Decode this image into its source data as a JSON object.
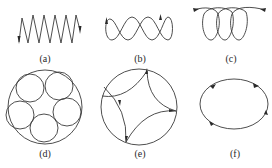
{
  "figure": {
    "panels": [
      {
        "id": "a",
        "label": "(a)",
        "shape": "zigzag-trajectory",
        "label_x": 45,
        "label_y": 54
      },
      {
        "id": "b",
        "label": "(b)",
        "shape": "figure-eight-chain-trajectory",
        "label_x": 140,
        "label_y": 54
      },
      {
        "id": "c",
        "label": "(c)",
        "shape": "looping-helix-trajectory",
        "label_x": 231,
        "label_y": 54
      },
      {
        "id": "d",
        "label": "(d)",
        "shape": "five-circles-in-circle",
        "label_x": 45,
        "label_y": 149
      },
      {
        "id": "e",
        "label": "(e)",
        "shape": "concave-arcs-in-circle",
        "label_x": 140,
        "label_y": 149
      },
      {
        "id": "f",
        "label": "(f)",
        "shape": "ellipse-orbit",
        "label_x": 235,
        "label_y": 149
      }
    ],
    "stroke_color": "#3a3a3a",
    "background": "#ffffff"
  }
}
